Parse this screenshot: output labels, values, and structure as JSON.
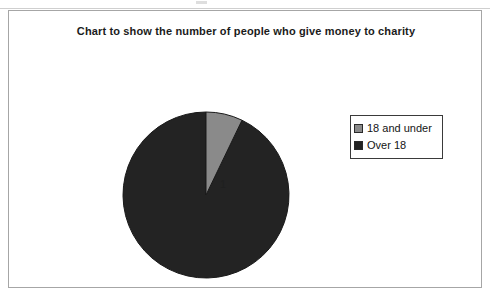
{
  "chart_data": {
    "type": "pie",
    "title": "Chart to show the number of people who give money to charity",
    "categories": [
      "18 and under",
      "Over 18"
    ],
    "values": [
      1,
      13
    ],
    "data_labels": [
      "1",
      "13"
    ],
    "colors": [
      "#8a8a8a",
      "#232323"
    ],
    "total": 14,
    "start_angle_deg": 0,
    "direction": "clockwise",
    "legend_position": "right",
    "grid": false,
    "xlabel": "",
    "ylabel": ""
  },
  "legend": {
    "entries": [
      {
        "label": "18 and under",
        "color": "#8a8a8a"
      },
      {
        "label": "Over 18",
        "color": "#232323"
      }
    ]
  }
}
